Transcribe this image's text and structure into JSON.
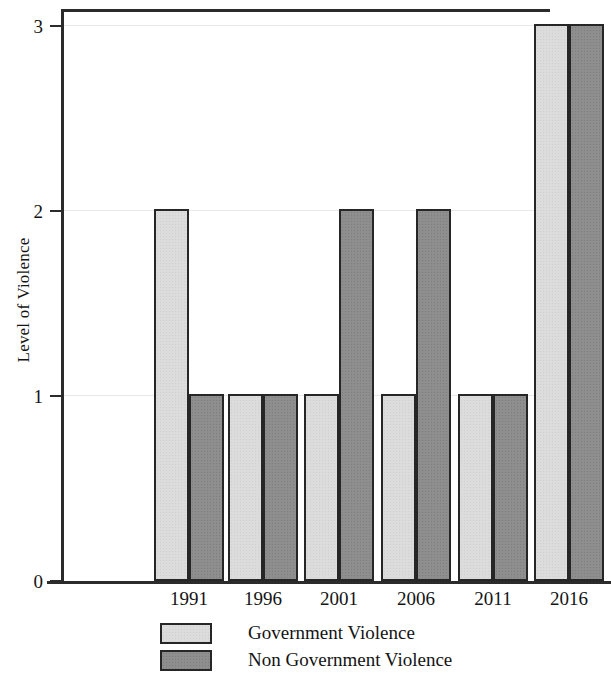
{
  "chart_data": {
    "type": "bar",
    "title": "",
    "subtitle": "",
    "xlabel": "",
    "ylabel": "Level of Violence",
    "categories": [
      "1991",
      "1996",
      "2001",
      "2006",
      "2011",
      "2016"
    ],
    "series": [
      {
        "name": "Government Violence",
        "values": [
          2,
          1,
          1,
          1,
          1,
          3
        ],
        "color": "#dcdcdc"
      },
      {
        "name": "Non Government Violence",
        "values": [
          1,
          1,
          2,
          2,
          1,
          3
        ],
        "color": "#8e8e8e"
      }
    ],
    "ylim": [
      0,
      3
    ],
    "yticks": [
      0,
      1,
      2,
      3
    ],
    "ytick_labels": [
      "0",
      "1",
      "2",
      "3"
    ],
    "grid": true,
    "grid_axis": "y",
    "legend_position": "bottom",
    "bar_border_color": "#262626",
    "axis_color": "#2b2b2b",
    "background_color": "#ffffff"
  },
  "axes": {
    "y_title": "Level of Violence",
    "y_ticks": [
      {
        "label": "3",
        "value": 3
      },
      {
        "label": "2",
        "value": 2
      },
      {
        "label": "1",
        "value": 1
      },
      {
        "label": "0",
        "value": 0
      }
    ],
    "x_ticks": [
      {
        "label": "1991"
      },
      {
        "label": "1996"
      },
      {
        "label": "2001"
      },
      {
        "label": "2006"
      },
      {
        "label": "2011"
      },
      {
        "label": "2016"
      }
    ]
  },
  "legend": {
    "items": [
      {
        "label": "Government Violence",
        "swatch": "light-gray"
      },
      {
        "label": "Non Government Violence",
        "swatch": "dark-gray"
      }
    ]
  }
}
